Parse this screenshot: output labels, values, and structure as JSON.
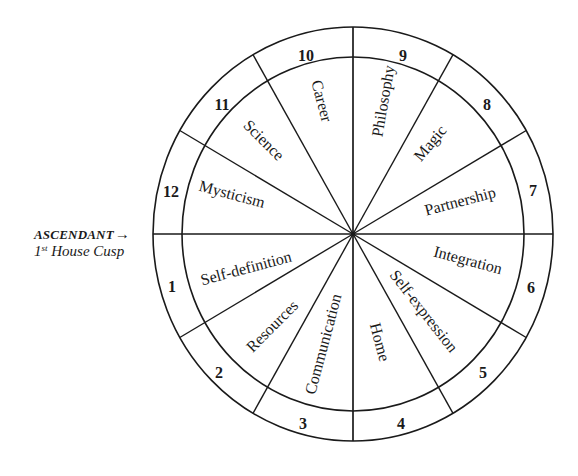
{
  "diagram": {
    "type": "astrological-house-wheel",
    "center": {
      "x": 353,
      "y": 234
    },
    "outer_ring": {
      "rx": 200,
      "ry": 207
    },
    "inner_ring": {
      "rx": 171,
      "ry": 177
    },
    "line_color": "#1a1a1a",
    "spoke_angles_deg": [
      0,
      30,
      60,
      90,
      120,
      150,
      180,
      210,
      240,
      270,
      300,
      330
    ]
  },
  "ascendant": {
    "title": "ASCENDANT",
    "arrow": "→",
    "subtitle_number": "1",
    "subtitle_suffix": "st",
    "subtitle_text": " House Cusp"
  },
  "houses": [
    {
      "number": "1",
      "meaning": "Self-definition",
      "num_pos": [
        172,
        286
      ],
      "label_pos": [
        246,
        268
      ],
      "label_rot": -15
    },
    {
      "number": "2",
      "meaning": "Resources",
      "num_pos": [
        219,
        372
      ],
      "label_pos": [
        272,
        326
      ],
      "label_rot": -45
    },
    {
      "number": "3",
      "meaning": "Communication",
      "num_pos": [
        303,
        423
      ],
      "label_pos": [
        323,
        344
      ],
      "label_rot": -75
    },
    {
      "number": "4",
      "meaning": "Home",
      "num_pos": [
        401,
        423
      ],
      "label_pos": [
        380,
        342
      ],
      "label_rot": 75
    },
    {
      "number": "5",
      "meaning": "Self-expression",
      "num_pos": [
        483,
        372
      ],
      "label_pos": [
        424,
        311
      ],
      "label_rot": 52
    },
    {
      "number": "6",
      "meaning": "Integration",
      "num_pos": [
        531,
        287
      ],
      "label_pos": [
        468,
        260
      ],
      "label_rot": 15
    },
    {
      "number": "7",
      "meaning": "Partnership",
      "num_pos": [
        533,
        190
      ],
      "label_pos": [
        460,
        201
      ],
      "label_rot": -15
    },
    {
      "number": "8",
      "meaning": "Magic",
      "num_pos": [
        487,
        104
      ],
      "label_pos": [
        430,
        143
      ],
      "label_rot": -50
    },
    {
      "number": "9",
      "meaning": "Philosophy",
      "num_pos": [
        403,
        55
      ],
      "label_pos": [
        383,
        101
      ],
      "label_rot": -80
    },
    {
      "number": "10",
      "meaning": "Career",
      "num_pos": [
        306,
        55
      ],
      "label_pos": [
        322,
        101
      ],
      "label_rot": 75
    },
    {
      "number": "11",
      "meaning": "Science",
      "num_pos": [
        222,
        104
      ],
      "label_pos": [
        264,
        140
      ],
      "label_rot": 45
    },
    {
      "number": "12",
      "meaning": "Mysticism",
      "num_pos": [
        171,
        191
      ],
      "label_pos": [
        232,
        194
      ],
      "label_rot": 15
    }
  ]
}
